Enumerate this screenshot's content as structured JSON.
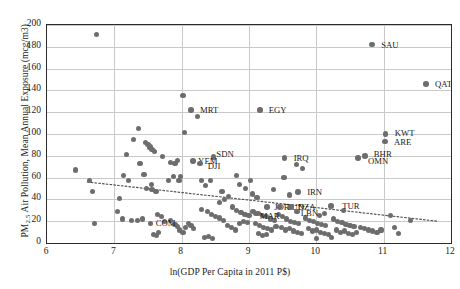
{
  "chart_data": {
    "type": "scatter",
    "title": "",
    "xlabel": "ln(GDP Per Capita in 2011 P$)",
    "ylabel_prefix": "PM",
    "ylabel_sub": "2.5",
    "ylabel_rest": " Air Pollution, Mean Annual Exposure (mcg/m3)",
    "ylabel": "PM2.5 Air Pollution, Mean Annual Exposure (mcg/m3)",
    "xlim": [
      6,
      12
    ],
    "ylim": [
      0,
      200
    ],
    "xticks": [
      "6",
      "7",
      "8",
      "9",
      "10",
      "11",
      "12"
    ],
    "yticks": [
      "0",
      "20",
      "40",
      "60",
      "80",
      "100",
      "120",
      "140",
      "160",
      "180",
      "200"
    ],
    "grid": "both",
    "legend": "none",
    "point_color": "#6d6d6d",
    "trendline": {
      "style": "dotted",
      "color": "#555555",
      "x": [
        6.6,
        11.8
      ],
      "y": [
        56,
        20
      ]
    },
    "labeled_points": [
      {
        "label": "SAU",
        "x": 10.83,
        "y": 182,
        "lx": 9,
        "ly": -4
      },
      {
        "label": "QAT",
        "x": 11.63,
        "y": 146,
        "lx": 9,
        "ly": -4
      },
      {
        "label": "MRT",
        "x": 8.14,
        "y": 122,
        "lx": 9,
        "ly": -4
      },
      {
        "label": "EGY",
        "x": 9.16,
        "y": 122,
        "lx": 9,
        "ly": -4
      },
      {
        "label": "KWT",
        "x": 11.03,
        "y": 100,
        "lx": 9,
        "ly": -5
      },
      {
        "label": "ARE",
        "x": 11.02,
        "y": 93,
        "lx": 9,
        "ly": -4
      },
      {
        "label": "BHR",
        "x": 10.72,
        "y": 80,
        "lx": 9,
        "ly": -6
      },
      {
        "label": "OMN",
        "x": 10.62,
        "y": 78,
        "lx": 10,
        "ly": -1
      },
      {
        "label": "SDN",
        "x": 8.47,
        "y": 79,
        "lx": 3,
        "ly": -7
      },
      {
        "label": "YEM",
        "x": 8.17,
        "y": 75,
        "lx": 5,
        "ly": -4
      },
      {
        "label": "DJI",
        "x": 8.27,
        "y": 73,
        "lx": 8,
        "ly": -1
      },
      {
        "label": "IRQ",
        "x": 9.53,
        "y": 78,
        "lx": 9,
        "ly": -4
      },
      {
        "label": "IRN",
        "x": 9.73,
        "y": 47,
        "lx": 9,
        "ly": -4
      },
      {
        "label": "TUR",
        "x": 10.22,
        "y": 34,
        "lx": 11,
        "ly": -4
      },
      {
        "label": "JOR",
        "x": 9.27,
        "y": 33,
        "lx": 7,
        "ly": -4
      },
      {
        "label": "TUN",
        "x": 9.45,
        "y": 33,
        "lx": 7,
        "ly": -4
      },
      {
        "label": "DZA",
        "x": 9.62,
        "y": 33,
        "lx": 7,
        "ly": -4
      },
      {
        "label": "LBN",
        "x": 9.71,
        "y": 29,
        "lx": 4,
        "ly": -2
      },
      {
        "label": "MAR",
        "x": 9.1,
        "y": 27,
        "lx": 4,
        "ly": -2
      },
      {
        "label": "COM",
        "x": 7.54,
        "y": 18,
        "lx": 5,
        "ly": -4
      }
    ],
    "points": [
      {
        "x": 6.74,
        "y": 191
      },
      {
        "x": 6.42,
        "y": 67
      },
      {
        "x": 6.63,
        "y": 57
      },
      {
        "x": 6.67,
        "y": 47
      },
      {
        "x": 6.7,
        "y": 18
      },
      {
        "x": 7.18,
        "y": 81
      },
      {
        "x": 7.14,
        "y": 62
      },
      {
        "x": 7.21,
        "y": 57
      },
      {
        "x": 7.08,
        "y": 41
      },
      {
        "x": 7.05,
        "y": 29
      },
      {
        "x": 7.12,
        "y": 22
      },
      {
        "x": 7.26,
        "y": 21
      },
      {
        "x": 7.34,
        "y": 21
      },
      {
        "x": 7.42,
        "y": 22
      },
      {
        "x": 7.29,
        "y": 95
      },
      {
        "x": 7.36,
        "y": 105
      },
      {
        "x": 7.46,
        "y": 92
      },
      {
        "x": 7.5,
        "y": 90
      },
      {
        "x": 7.53,
        "y": 88
      },
      {
        "x": 7.56,
        "y": 86
      },
      {
        "x": 7.6,
        "y": 84
      },
      {
        "x": 7.38,
        "y": 73
      },
      {
        "x": 7.44,
        "y": 63
      },
      {
        "x": 7.48,
        "y": 50
      },
      {
        "x": 7.56,
        "y": 49
      },
      {
        "x": 7.62,
        "y": 47
      },
      {
        "x": 7.55,
        "y": 54
      },
      {
        "x": 7.64,
        "y": 26
      },
      {
        "x": 7.7,
        "y": 24
      },
      {
        "x": 7.74,
        "y": 20
      },
      {
        "x": 7.58,
        "y": 8
      },
      {
        "x": 7.63,
        "y": 7
      },
      {
        "x": 7.66,
        "y": 10
      },
      {
        "x": 7.72,
        "y": 79
      },
      {
        "x": 7.84,
        "y": 74
      },
      {
        "x": 7.9,
        "y": 73
      },
      {
        "x": 7.94,
        "y": 76
      },
      {
        "x": 7.96,
        "y": 57
      },
      {
        "x": 7.8,
        "y": 57
      },
      {
        "x": 7.88,
        "y": 61
      },
      {
        "x": 7.98,
        "y": 61
      },
      {
        "x": 7.83,
        "y": 21
      },
      {
        "x": 7.9,
        "y": 17
      },
      {
        "x": 7.94,
        "y": 15
      },
      {
        "x": 7.97,
        "y": 12
      },
      {
        "x": 8.02,
        "y": 10
      },
      {
        "x": 8.06,
        "y": 14
      },
      {
        "x": 8.1,
        "y": 18
      },
      {
        "x": 8.14,
        "y": 16
      },
      {
        "x": 8.18,
        "y": 13
      },
      {
        "x": 8.02,
        "y": 135
      },
      {
        "x": 8.04,
        "y": 101
      },
      {
        "x": 8.24,
        "y": 116
      },
      {
        "x": 8.3,
        "y": 57
      },
      {
        "x": 8.36,
        "y": 53
      },
      {
        "x": 8.43,
        "y": 57
      },
      {
        "x": 8.3,
        "y": 31
      },
      {
        "x": 8.38,
        "y": 29
      },
      {
        "x": 8.44,
        "y": 26
      },
      {
        "x": 8.5,
        "y": 24
      },
      {
        "x": 8.56,
        "y": 23
      },
      {
        "x": 8.62,
        "y": 21
      },
      {
        "x": 8.34,
        "y": 5
      },
      {
        "x": 8.4,
        "y": 6
      },
      {
        "x": 8.46,
        "y": 4
      },
      {
        "x": 8.56,
        "y": 37
      },
      {
        "x": 8.64,
        "y": 40
      },
      {
        "x": 8.7,
        "y": 43
      },
      {
        "x": 8.76,
        "y": 33
      },
      {
        "x": 8.82,
        "y": 30
      },
      {
        "x": 8.88,
        "y": 28
      },
      {
        "x": 8.94,
        "y": 26
      },
      {
        "x": 9.0,
        "y": 25
      },
      {
        "x": 8.68,
        "y": 16
      },
      {
        "x": 8.74,
        "y": 14
      },
      {
        "x": 8.8,
        "y": 12
      },
      {
        "x": 8.86,
        "y": 18
      },
      {
        "x": 8.92,
        "y": 20
      },
      {
        "x": 8.98,
        "y": 19
      },
      {
        "x": 8.86,
        "y": 54
      },
      {
        "x": 8.95,
        "y": 50
      },
      {
        "x": 9.05,
        "y": 45
      },
      {
        "x": 9.12,
        "y": 42
      },
      {
        "x": 9.06,
        "y": 29
      },
      {
        "x": 9.14,
        "y": 27
      },
      {
        "x": 9.2,
        "y": 25
      },
      {
        "x": 9.26,
        "y": 24
      },
      {
        "x": 9.32,
        "y": 22
      },
      {
        "x": 9.38,
        "y": 21
      },
      {
        "x": 9.1,
        "y": 18
      },
      {
        "x": 9.16,
        "y": 16
      },
      {
        "x": 9.22,
        "y": 14
      },
      {
        "x": 9.28,
        "y": 13
      },
      {
        "x": 9.34,
        "y": 12
      },
      {
        "x": 9.4,
        "y": 15
      },
      {
        "x": 9.14,
        "y": 9
      },
      {
        "x": 9.2,
        "y": 7
      },
      {
        "x": 9.26,
        "y": 8
      },
      {
        "x": 9.44,
        "y": 26
      },
      {
        "x": 9.5,
        "y": 24
      },
      {
        "x": 9.56,
        "y": 22
      },
      {
        "x": 9.62,
        "y": 20
      },
      {
        "x": 9.68,
        "y": 19
      },
      {
        "x": 9.74,
        "y": 18
      },
      {
        "x": 9.48,
        "y": 14
      },
      {
        "x": 9.54,
        "y": 12
      },
      {
        "x": 9.6,
        "y": 13
      },
      {
        "x": 9.66,
        "y": 11
      },
      {
        "x": 9.72,
        "y": 10
      },
      {
        "x": 9.78,
        "y": 9
      },
      {
        "x": 9.52,
        "y": 60
      },
      {
        "x": 9.7,
        "y": 72
      },
      {
        "x": 9.84,
        "y": 23
      },
      {
        "x": 9.9,
        "y": 21
      },
      {
        "x": 9.96,
        "y": 20
      },
      {
        "x": 10.02,
        "y": 18
      },
      {
        "x": 10.08,
        "y": 17
      },
      {
        "x": 10.14,
        "y": 16
      },
      {
        "x": 9.88,
        "y": 13
      },
      {
        "x": 9.94,
        "y": 11
      },
      {
        "x": 10.0,
        "y": 12
      },
      {
        "x": 10.06,
        "y": 10
      },
      {
        "x": 10.12,
        "y": 9
      },
      {
        "x": 10.18,
        "y": 8
      },
      {
        "x": 10.05,
        "y": 25
      },
      {
        "x": 10.12,
        "y": 27
      },
      {
        "x": 10.26,
        "y": 22
      },
      {
        "x": 10.32,
        "y": 20
      },
      {
        "x": 10.38,
        "y": 19
      },
      {
        "x": 10.44,
        "y": 17
      },
      {
        "x": 10.5,
        "y": 16
      },
      {
        "x": 10.56,
        "y": 15
      },
      {
        "x": 10.3,
        "y": 12
      },
      {
        "x": 10.36,
        "y": 10
      },
      {
        "x": 10.42,
        "y": 11
      },
      {
        "x": 10.48,
        "y": 9
      },
      {
        "x": 10.54,
        "y": 8
      },
      {
        "x": 10.6,
        "y": 10
      },
      {
        "x": 10.66,
        "y": 14
      },
      {
        "x": 10.72,
        "y": 13
      },
      {
        "x": 10.78,
        "y": 12
      },
      {
        "x": 10.84,
        "y": 11
      },
      {
        "x": 10.9,
        "y": 10
      },
      {
        "x": 10.96,
        "y": 12
      },
      {
        "x": 11.1,
        "y": 25
      },
      {
        "x": 11.16,
        "y": 14
      },
      {
        "x": 11.22,
        "y": 9
      },
      {
        "x": 11.4,
        "y": 21
      },
      {
        "x": 8.82,
        "y": 62
      },
      {
        "x": 9.02,
        "y": 57
      },
      {
        "x": 9.36,
        "y": 49
      },
      {
        "x": 9.6,
        "y": 44
      },
      {
        "x": 8.6,
        "y": 47
      },
      {
        "x": 9.8,
        "y": 68
      },
      {
        "x": 10.4,
        "y": 30
      },
      {
        "x": 10.22,
        "y": 5
      },
      {
        "x": 10.0,
        "y": 4
      }
    ]
  }
}
